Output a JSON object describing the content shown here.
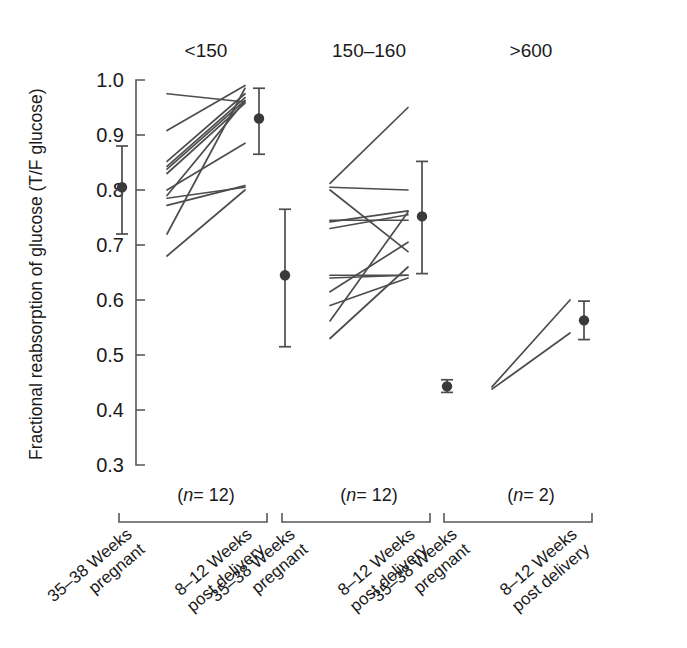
{
  "figure": {
    "title": "",
    "y_axis_title": "Fractional reabsorption of glucose (T/F glucose)"
  },
  "chart_data": {
    "type": "line",
    "title": "",
    "subtitle": "",
    "xlabel": "",
    "ylabel": "Fractional reabsorption of glucose (T/F glucose)",
    "ylim": [
      0.3,
      1.0
    ],
    "yticks": [
      0.3,
      0.4,
      0.5,
      0.6,
      0.7,
      0.8,
      0.9,
      1.0
    ],
    "ytick_labels": [
      "0.3",
      "0.4",
      "0.5",
      "0.6",
      "0.7",
      "0.8",
      "0.9",
      "1.0"
    ],
    "grid": false,
    "legend": "none",
    "x_categories": [
      "35–38 Weeks pregnant",
      "8–12 Weeks post delivery"
    ],
    "panels": [
      {
        "header": "<150",
        "n_label_prefix": "(",
        "n_label_italic": "n",
        "n_label_suffix": "= 12)",
        "n": 12,
        "series": [
          {
            "name": "subject-1",
            "values": [
              0.975,
              0.96
            ]
          },
          {
            "name": "subject-2",
            "values": [
              0.908,
              0.99
            ]
          },
          {
            "name": "subject-3",
            "values": [
              0.852,
              0.975
            ]
          },
          {
            "name": "subject-4",
            "values": [
              0.843,
              0.968
            ]
          },
          {
            "name": "subject-5",
            "values": [
              0.838,
              0.963
            ]
          },
          {
            "name": "subject-6",
            "values": [
              0.83,
              0.958
            ]
          },
          {
            "name": "subject-7",
            "values": [
              0.8,
              0.885
            ]
          },
          {
            "name": "subject-8",
            "values": [
              0.79,
              0.962
            ]
          },
          {
            "name": "subject-9",
            "values": [
              0.785,
              0.805
            ]
          },
          {
            "name": "subject-10",
            "values": [
              0.772,
              0.808
            ]
          },
          {
            "name": "subject-11",
            "values": [
              0.72,
              0.985
            ]
          },
          {
            "name": "subject-12",
            "values": [
              0.68,
              0.8
            ]
          }
        ],
        "means": [
          {
            "x_index": 0,
            "mean": 0.805,
            "lower": 0.72,
            "upper": 0.88
          },
          {
            "x_index": 1,
            "mean": 0.93,
            "lower": 0.865,
            "upper": 0.985
          }
        ]
      },
      {
        "header": "150–160",
        "n_label_prefix": "(",
        "n_label_italic": "n",
        "n_label_suffix": "= 12)",
        "n": 12,
        "series": [
          {
            "name": "subject-1",
            "values": [
              0.812,
              0.95
            ]
          },
          {
            "name": "subject-2",
            "values": [
              0.805,
              0.8
            ]
          },
          {
            "name": "subject-3",
            "values": [
              0.8,
              0.688
            ]
          },
          {
            "name": "subject-4",
            "values": [
              0.745,
              0.745
            ]
          },
          {
            "name": "subject-5",
            "values": [
              0.742,
              0.762
            ]
          },
          {
            "name": "subject-6",
            "values": [
              0.73,
              0.755
            ]
          },
          {
            "name": "subject-7",
            "values": [
              0.645,
              0.645
            ]
          },
          {
            "name": "subject-8",
            "values": [
              0.64,
              0.645
            ]
          },
          {
            "name": "subject-9",
            "values": [
              0.615,
              0.705
            ]
          },
          {
            "name": "subject-10",
            "values": [
              0.59,
              0.64
            ]
          },
          {
            "name": "subject-11",
            "values": [
              0.562,
              0.76
            ]
          },
          {
            "name": "subject-12",
            "values": [
              0.53,
              0.66
            ]
          }
        ],
        "means": [
          {
            "x_index": 0,
            "mean": 0.645,
            "lower": 0.515,
            "upper": 0.765
          },
          {
            "x_index": 1,
            "mean": 0.752,
            "lower": 0.648,
            "upper": 0.852
          }
        ]
      },
      {
        "header": ">600",
        "n_label_prefix": "(",
        "n_label_italic": "n",
        "n_label_suffix": "= 2)",
        "n": 2,
        "series": [
          {
            "name": "subject-1",
            "values": [
              0.442,
              0.6
            ]
          },
          {
            "name": "subject-2",
            "values": [
              0.438,
              0.54
            ]
          }
        ],
        "means": [
          {
            "x_index": 0,
            "mean": 0.443,
            "lower": 0.432,
            "upper": 0.455
          },
          {
            "x_index": 1,
            "mean": 0.563,
            "lower": 0.528,
            "upper": 0.598
          }
        ]
      }
    ]
  },
  "geometry": {
    "axis_x": 136,
    "axis_top_y": 80,
    "axis_bottom_y": 465,
    "panel_line_width": 78,
    "panel_starts": [
      167,
      330,
      492
    ],
    "mean_offset_left": -45,
    "mean_offset_right": 14,
    "header_y": 57,
    "n_label_y": 501,
    "bracket_y": 522,
    "bracket_tick": 9,
    "cat_label_rotation": -40
  }
}
